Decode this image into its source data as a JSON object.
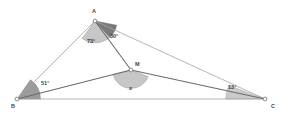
{
  "figure": {
    "kind": "geometry-diagram",
    "background_color": "#ffffff",
    "line_color": "#9a9a9a",
    "bold_line_color": "#6e6e6e",
    "arc_fill_light": "#b9b9b9",
    "arc_fill_dark": "#6f6f6f",
    "vertex_fill": "#ffffff",
    "vertex_stroke": "#7a7a7a",
    "text_color": "#3f3f3f"
  },
  "points": {
    "A": {
      "label": "A",
      "x": 95,
      "y": 21,
      "label_x": 92,
      "label_y": 9
    },
    "B": {
      "label": "B",
      "x": 17,
      "y": 99,
      "label_x": 11,
      "label_y": 104
    },
    "C": {
      "label": "C",
      "x": 265,
      "y": 99,
      "label_x": 271,
      "label_y": 104
    },
    "M": {
      "label": "M",
      "x": 131,
      "y": 70,
      "label_x": 135,
      "label_y": 62
    }
  },
  "segments": [
    {
      "name": "segment-AB",
      "from": "A",
      "to": "B",
      "weight": "thin"
    },
    {
      "name": "segment-AC",
      "from": "A",
      "to": "C",
      "weight": "thin"
    },
    {
      "name": "segment-BC",
      "from": "B",
      "to": "C",
      "weight": "thin"
    },
    {
      "name": "segment-AM",
      "from": "A",
      "to": "M",
      "weight": "bold"
    },
    {
      "name": "segment-BM",
      "from": "B",
      "to": "M",
      "weight": "bold"
    },
    {
      "name": "segment-MC",
      "from": "M",
      "to": "C",
      "weight": "bold"
    }
  ],
  "angles": [
    {
      "name": "angle-at-A-left",
      "vertex": "A",
      "value": "73°",
      "shade": "light",
      "label_x": 87,
      "label_y": 39
    },
    {
      "name": "angle-at-A-right",
      "vertex": "A",
      "value": "30°",
      "shade": "dark",
      "label_x": 110,
      "label_y": 34
    },
    {
      "name": "angle-at-B",
      "vertex": "B",
      "value": "51°",
      "shade": "dark",
      "label_x": 41,
      "label_y": 81
    },
    {
      "name": "angle-at-C",
      "vertex": "C",
      "value": "13°",
      "shade": "light",
      "label_x": 228,
      "label_y": 85
    },
    {
      "name": "angle-at-M-unknown",
      "vertex": "M",
      "value": "x",
      "shade": "light",
      "label_x": 129,
      "label_y": 86
    }
  ]
}
